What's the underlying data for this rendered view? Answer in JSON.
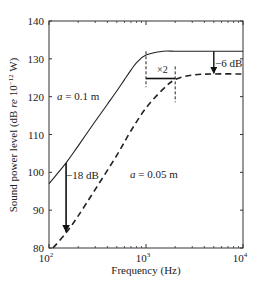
{
  "chart_data": {
    "type": "line",
    "title": "",
    "xlabel": "Frequency (Hz)",
    "ylabel": "Sound power level (dB re 10^-12 W)",
    "ylabel_parts": {
      "main": "Sound power level (dB ",
      "re": "re",
      "mid": " 10",
      "sup": "−12",
      "end": " W)"
    },
    "x_scale": "log",
    "xlim": [
      100,
      10000
    ],
    "ylim": [
      80,
      140
    ],
    "x_ticks": [
      {
        "value": 100,
        "base": "10",
        "exp": "2"
      },
      {
        "value": 1000,
        "base": "10",
        "exp": "3"
      },
      {
        "value": 10000,
        "base": "10",
        "exp": "4"
      }
    ],
    "y_ticks": [
      80,
      90,
      100,
      110,
      120,
      130,
      140
    ],
    "grid": false,
    "series": [
      {
        "name": "a = 0.1 m",
        "style": "solid",
        "x": [
          100,
          150,
          200,
          300,
          400,
          500,
          600,
          700,
          800,
          1000,
          1500,
          2000,
          3000,
          5000,
          10000
        ],
        "y": [
          97,
          102.5,
          107,
          113.5,
          118,
          121.5,
          124.5,
          127,
          129,
          131,
          132,
          132,
          132,
          132,
          132
        ]
      },
      {
        "name": "a = 0.05 m",
        "style": "dashed",
        "x": [
          110,
          150,
          200,
          300,
          500,
          700,
          1000,
          1500,
          2000,
          3000,
          5000,
          10000
        ],
        "y": [
          80,
          84,
          88.5,
          95.5,
          104.5,
          111,
          117,
          122,
          124.5,
          125.7,
          126,
          126
        ]
      }
    ],
    "annotations": [
      {
        "text": "a = 0.1 m",
        "italic_prefix": "a",
        "rest": " = 0.1 m"
      },
      {
        "text": "a = 0.05 m",
        "italic_prefix": "a",
        "rest": " = 0.05 m"
      },
      {
        "text": "−18 dB",
        "note": "vertical arrow at 150 Hz from solid to dashed curve"
      },
      {
        "text": "×2",
        "note": "horizontal bracket between 1000 Hz and 2000 Hz"
      },
      {
        "text": "−6 dB",
        "note": "vertical arrow at 5000 Hz from 132 dB to 126 dB"
      }
    ],
    "legend": "none (inline labels)"
  }
}
